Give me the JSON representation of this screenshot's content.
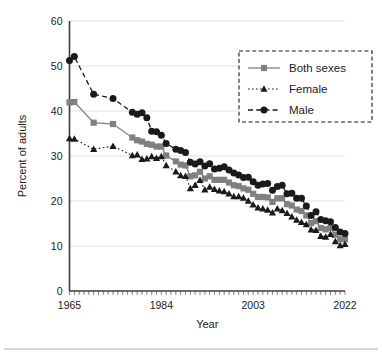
{
  "chart_data": {
    "type": "line",
    "title": "",
    "xlabel": "Year",
    "ylabel": "Percent of adults",
    "xlim": [
      1965,
      2022
    ],
    "ylim": [
      0,
      60
    ],
    "ytick_labels": [
      "0",
      "10",
      "20",
      "30",
      "40",
      "50",
      "60"
    ],
    "yticks": [
      0,
      10,
      20,
      30,
      40,
      50,
      60
    ],
    "xtick_labels": [
      "1965",
      "1984",
      "2003",
      "2022"
    ],
    "xticks": [
      1965,
      1984,
      2003,
      2022
    ],
    "grid": "horizontal",
    "legend_position": "top-right",
    "x": [
      1965,
      1966,
      1967,
      1968,
      1969,
      1970,
      1971,
      1972,
      1973,
      1974,
      1975,
      1976,
      1977,
      1978,
      1979,
      1980,
      1981,
      1982,
      1983,
      1984,
      1985,
      1986,
      1987,
      1988,
      1989,
      1990,
      1991,
      1992,
      1993,
      1994,
      1995,
      1996,
      1997,
      1998,
      1999,
      2000,
      2001,
      2002,
      2003,
      2004,
      2005,
      2006,
      2007,
      2008,
      2009,
      2010,
      2011,
      2012,
      2013,
      2014,
      2015,
      2016,
      2017,
      2018,
      2019,
      2020,
      2021,
      2022
    ],
    "series": [
      {
        "name": "Both sexes",
        "color": "#808080",
        "marker": "square",
        "linestyle": "solid",
        "values": [
          41.9,
          42.0,
          null,
          null,
          null,
          37.4,
          null,
          null,
          null,
          37.1,
          null,
          null,
          null,
          34.1,
          33.5,
          33.2,
          32.7,
          32.5,
          32.1,
          32.1,
          30.1,
          null,
          28.8,
          28.1,
          27.9,
          25.5,
          25.7,
          26.5,
          25.0,
          25.5,
          24.7,
          24.7,
          24.7,
          24.1,
          23.5,
          23.3,
          22.8,
          22.5,
          21.6,
          20.9,
          20.9,
          20.8,
          19.8,
          20.6,
          20.6,
          19.3,
          19.0,
          18.1,
          17.8,
          16.8,
          15.1,
          15.5,
          14.0,
          13.7,
          14.0,
          12.5,
          11.5,
          11.5
        ]
      },
      {
        "name": "Female",
        "color": "#1a1a1a",
        "marker": "triangle",
        "linestyle": "dotted",
        "values": [
          33.9,
          33.8,
          null,
          null,
          null,
          31.5,
          null,
          null,
          null,
          32.2,
          null,
          null,
          null,
          30.1,
          30.3,
          29.3,
          29.4,
          29.9,
          29.5,
          29.9,
          27.9,
          null,
          26.5,
          25.7,
          25.5,
          22.8,
          23.5,
          24.6,
          22.5,
          23.1,
          22.6,
          22.3,
          22.1,
          21.6,
          21.0,
          21.0,
          20.7,
          20.0,
          19.2,
          18.5,
          18.3,
          18.0,
          17.4,
          18.3,
          17.9,
          17.3,
          16.5,
          15.8,
          15.3,
          14.8,
          13.6,
          13.5,
          12.2,
          12.0,
          12.6,
          11.0,
          10.1,
          10.4
        ]
      },
      {
        "name": "Male",
        "color": "#1a1a1a",
        "marker": "circle",
        "linestyle": "dashed",
        "values": [
          51.2,
          52.1,
          null,
          null,
          null,
          43.7,
          null,
          null,
          null,
          42.8,
          null,
          null,
          null,
          39.7,
          39.3,
          39.6,
          38.5,
          35.5,
          35.4,
          34.6,
          32.8,
          null,
          31.5,
          31.2,
          30.8,
          28.6,
          28.2,
          28.7,
          27.8,
          28.3,
          27.1,
          27.3,
          27.6,
          26.9,
          26.2,
          25.8,
          25.2,
          25.3,
          24.3,
          23.5,
          23.8,
          23.9,
          22.4,
          23.2,
          23.5,
          21.6,
          21.7,
          20.6,
          20.6,
          18.9,
          16.8,
          17.6,
          15.9,
          15.6,
          15.4,
          14.1,
          13.1,
          12.8
        ]
      }
    ]
  },
  "legend": {
    "entries": [
      {
        "label": "Both sexes"
      },
      {
        "label": "Female"
      },
      {
        "label": "Male"
      }
    ]
  },
  "axes": {
    "x_title": "Year",
    "y_title": "Percent of adults"
  }
}
